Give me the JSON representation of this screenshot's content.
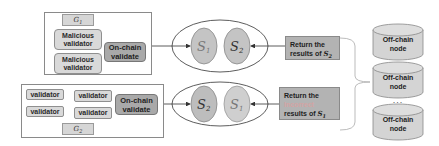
{
  "group1": {
    "label": "G",
    "label_sub": "1",
    "validators": [
      "Malicious validator",
      "Malicious validator"
    ],
    "onchain": "On-chain validate"
  },
  "group2": {
    "label": "G",
    "label_sub": "2",
    "validators": [
      "validator",
      "validator",
      "validator",
      "validator"
    ],
    "onchain": "On-chain validate"
  },
  "ellipse1": {
    "left": {
      "label": "S",
      "sub": "1"
    },
    "right": {
      "label": "S",
      "sub": "2"
    }
  },
  "ellipse2": {
    "left": {
      "label": "S",
      "sub": "2"
    },
    "right": {
      "label": "S",
      "sub": "1"
    }
  },
  "return1": {
    "line1": "Return the",
    "line2": "results of ",
    "sym": "S",
    "sub": "2"
  },
  "return2": {
    "line1": "Return the",
    "faint": "Incorrect",
    "line3": "results of ",
    "sym": "S",
    "sub": "1"
  },
  "nodes": [
    {
      "line1": "Off-chain",
      "line2": "node"
    },
    {
      "line1": "Off-chain",
      "line2": "node"
    },
    {
      "line1": "Off-chain",
      "line2": "node"
    }
  ],
  "ellipsis": "..."
}
